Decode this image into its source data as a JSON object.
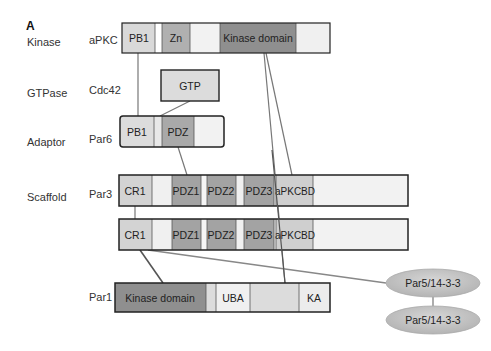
{
  "panel_label": "A",
  "colors": {
    "dark": "#8a8a8a",
    "medium": "#a9a9a9",
    "light": "#d3d3d3",
    "pale": "#eeeeee",
    "white": "#ffffff",
    "outline": "#222222",
    "connector": "#666666",
    "ellipse": "#c4c4c4"
  },
  "rows": [
    {
      "category": "Kinase",
      "protein": "aPKC"
    },
    {
      "category": "GTPase",
      "protein": "Cdc42"
    },
    {
      "category": "Adaptor",
      "protein": "Par6"
    },
    {
      "category": "Scaffold",
      "protein": "Par3"
    },
    {
      "category": "",
      "protein": "Par1"
    }
  ],
  "proteins": {
    "aPKC": {
      "domains": [
        "PB1",
        "",
        "Zn",
        "",
        "Kinase domain",
        ""
      ]
    },
    "Cdc42": {
      "domains": [
        "GTP"
      ]
    },
    "Par6": {
      "domains": [
        "PB1",
        "",
        "PDZ",
        ""
      ]
    },
    "Par3_a": {
      "domains": [
        "CR1",
        "",
        "PDZ1",
        "",
        "PDZ2",
        "",
        "PDZ3",
        "aPKCBD",
        ""
      ]
    },
    "Par3_b": {
      "domains": [
        "CR1",
        "",
        "PDZ1",
        "",
        "PDZ2",
        "",
        "PDZ3",
        "aPKCBD",
        ""
      ]
    },
    "Par1": {
      "domains": [
        "Kinase domain",
        "",
        "UBA",
        "",
        "KA"
      ]
    }
  },
  "ellipses": [
    "Par5/14-3-3",
    "Par5/14-3-3"
  ]
}
